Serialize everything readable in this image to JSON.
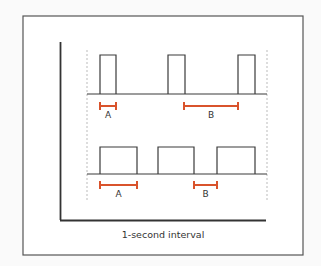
{
  "diagram": {
    "caption": "1-second interval",
    "colors": {
      "line": "#3a3a3a",
      "accent": "#d9532c",
      "dashed": "#aaaaaa",
      "frame": "#555555"
    },
    "top_row": {
      "pulses": [
        {
          "x1": 100,
          "x2": 116
        },
        {
          "x1": 168,
          "x2": 185
        },
        {
          "x1": 238,
          "x2": 255
        }
      ],
      "markers": [
        {
          "label": "A",
          "x1": 100,
          "x2": 116
        },
        {
          "label": "B",
          "x1": 184,
          "x2": 238
        }
      ]
    },
    "bottom_row": {
      "pulses": [
        {
          "x1": 100,
          "x2": 137
        },
        {
          "x1": 158,
          "x2": 194
        },
        {
          "x1": 217,
          "x2": 255
        }
      ],
      "markers": [
        {
          "label": "A",
          "x1": 100,
          "x2": 137
        },
        {
          "label": "B",
          "x1": 194,
          "x2": 217
        }
      ]
    }
  }
}
